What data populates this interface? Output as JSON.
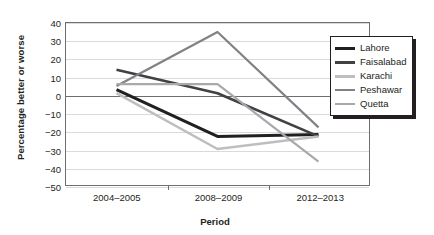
{
  "chart_data": {
    "type": "line",
    "title": "",
    "xlabel": "Period",
    "ylabel": "Percentage better or worse",
    "categories": [
      "2004–2005",
      "2008–2009",
      "2012–2013"
    ],
    "ylim": [
      -50,
      40
    ],
    "yticks": [
      40,
      30,
      20,
      10,
      0,
      -10,
      -20,
      -30,
      -40,
      -50
    ],
    "ytick_labels": [
      "40",
      "30",
      "20",
      "10",
      "0",
      "−10",
      "−20",
      "−30",
      "−40",
      "−50"
    ],
    "grid": true,
    "legend_position": "right",
    "series": [
      {
        "name": "Lahore",
        "color": "#231f20",
        "width": 3,
        "values": [
          3,
          -23,
          -22
        ]
      },
      {
        "name": "Faisalabad",
        "color": "#414042",
        "width": 2.6,
        "values": [
          14,
          1,
          -23
        ]
      },
      {
        "name": "Karachi",
        "color": "#bcbec0",
        "width": 2.6,
        "values": [
          1,
          -30,
          -23
        ]
      },
      {
        "name": "Peshawar",
        "color": "#808285",
        "width": 2.2,
        "values": [
          5,
          35,
          -18
        ]
      },
      {
        "name": "Quetta",
        "color": "#a7a9ac",
        "width": 2.2,
        "values": [
          6,
          6,
          -37
        ]
      }
    ]
  },
  "axes": {
    "ylabel": "Percentage better or worse",
    "xlabel": "Period"
  },
  "legend": {
    "items": [
      {
        "label": "Lahore"
      },
      {
        "label": "Faisalabad"
      },
      {
        "label": "Karachi"
      },
      {
        "label": "Peshawar"
      },
      {
        "label": "Quetta"
      }
    ]
  }
}
